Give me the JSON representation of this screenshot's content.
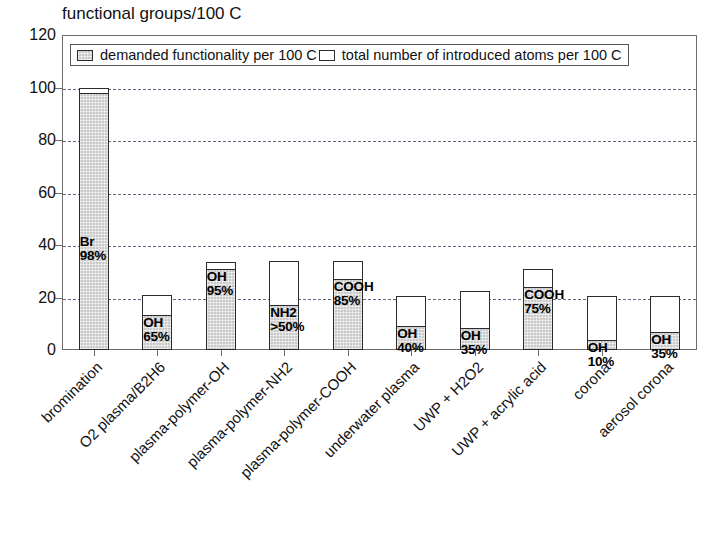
{
  "chart_data": {
    "type": "bar",
    "title": "functional groups/100 C",
    "xlabel": "",
    "ylabel": "",
    "ylim": [
      0,
      120
    ],
    "yticks": [
      0,
      20,
      40,
      60,
      80,
      100,
      120
    ],
    "grid": true,
    "stacked": true,
    "legend_position": "top-inside-left",
    "categories": [
      "bromination",
      "O2 plasma/B2H6",
      "plasma-polymer-OH",
      "plasma-polymer-NH2",
      "plasma-polymer-COOH",
      "underwater plasma",
      "UWP + H2O2",
      "UWP + acrylic acid",
      "corona",
      "aerosol corona"
    ],
    "series": [
      {
        "name": "demanded functionality per 100 C",
        "fill": "hatched-gray",
        "values": [
          98,
          13.5,
          31,
          17,
          27,
          9,
          8.5,
          24,
          4,
          7
        ]
      },
      {
        "name": "total number of introduced atoms per 100 C",
        "fill": "white",
        "values": [
          100,
          21,
          33.5,
          34,
          34,
          20.5,
          22.5,
          31,
          20.5,
          20.5
        ]
      }
    ],
    "bar_annotations": [
      {
        "group": "Br",
        "percent": "98%"
      },
      {
        "group": "OH",
        "percent": "65%"
      },
      {
        "group": "OH",
        "percent": "95%"
      },
      {
        "group": "NH2",
        "percent": ">50%"
      },
      {
        "group": "COOH",
        "percent": "85%"
      },
      {
        "group": "OH",
        "percent": "40%"
      },
      {
        "group": "OH",
        "percent": "35%"
      },
      {
        "group": "COOH",
        "percent": "75%"
      },
      {
        "group": "OH",
        "percent": "10%"
      },
      {
        "group": "OH",
        "percent": "35%"
      }
    ]
  },
  "legend": {
    "items": [
      {
        "label": "demanded functionality per 100 C",
        "swatch": "filled"
      },
      {
        "label": "total number of introduced atoms per 100 C",
        "swatch": "hollow"
      }
    ]
  },
  "colors": {
    "bar_fill": "#c9c9c9",
    "bar_stroke": "#2b2b2b",
    "gridline": "#4a4a6a",
    "frame": "#6b6b6b",
    "text": "#111111",
    "background": "#ffffff"
  },
  "xlabels": [
    {
      "text": "bromination"
    },
    {
      "text": "O2 plasma/B2H6"
    },
    {
      "text": "plasma-polymer-OH"
    },
    {
      "text": "plasma-polymer-NH2"
    },
    {
      "text": "plasma-polymer-COOH"
    },
    {
      "text": "underwater plasma"
    },
    {
      "text": "UWP + H2O2"
    },
    {
      "text": "UWP + acrylic acid"
    },
    {
      "text": "corona"
    },
    {
      "text": "aerosol corona"
    }
  ],
  "yticklabels": [
    "120",
    "100",
    "80",
    "60",
    "40",
    "20",
    "0"
  ]
}
